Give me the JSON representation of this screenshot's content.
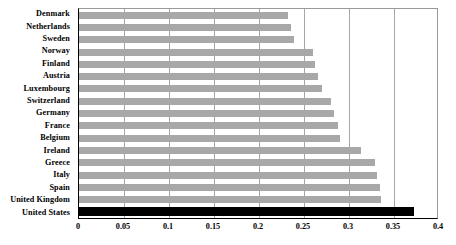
{
  "chart_data": {
    "type": "bar",
    "orientation": "horizontal",
    "title": "",
    "xlabel": "",
    "ylabel": "",
    "xlim": [
      0,
      0.4
    ],
    "xticks": [
      "0",
      "0.05",
      "0.1",
      "0.15",
      "0.2",
      "0.25",
      "0.3",
      "0.35",
      "0.4"
    ],
    "xtick_values": [
      0,
      0.05,
      0.1,
      0.15,
      0.2,
      0.25,
      0.3,
      0.35,
      0.4
    ],
    "grid": true,
    "legend": "none",
    "categories": [
      "Denmark",
      "Netherlands",
      "Sweden",
      "Norway",
      "Finland",
      "Austria",
      "Luxembourg",
      "Switzerland",
      "Germany",
      "France",
      "Belgium",
      "Ireland",
      "Greece",
      "Italy",
      "Spain",
      "United Kingdom",
      "United States"
    ],
    "values": [
      0.232,
      0.236,
      0.239,
      0.26,
      0.262,
      0.265,
      0.27,
      0.28,
      0.283,
      0.288,
      0.29,
      0.313,
      0.329,
      0.331,
      0.334,
      0.336,
      0.372
    ],
    "bar_color": "#a8a8a8",
    "highlight_color": "#000000",
    "highlight_category": "United States"
  },
  "axis": {
    "gridline_color": "#a6a6a6",
    "frame_color": "#000000"
  }
}
